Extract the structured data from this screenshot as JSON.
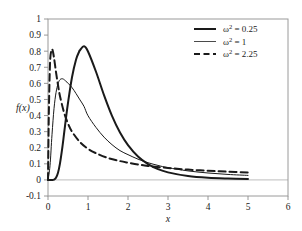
{
  "chart_data": {
    "type": "line",
    "title": "",
    "subtitle": "",
    "xlabel": "x",
    "ylabel": "f(x)",
    "xlim": [
      0,
      6
    ],
    "ylim": [
      -0.1,
      1
    ],
    "xticks": [
      0,
      1,
      2,
      3,
      4,
      5,
      6
    ],
    "xtick_labels": [
      "0",
      "1",
      "2",
      "3",
      "4",
      "5",
      "6"
    ],
    "yticks": [
      -0.1,
      0,
      0.1,
      0.2,
      0.3,
      0.4,
      0.5,
      0.6,
      0.7,
      0.8,
      0.9,
      1
    ],
    "ytick_labels": [
      "-0.1",
      "0",
      "0.1",
      "0.2",
      "0.3",
      "0.4",
      "0.5",
      "0.6",
      "0.7",
      "0.8",
      "0.9",
      "1"
    ],
    "grid": false,
    "legend_position": "top-right",
    "distribution": "lognormal",
    "mu": 0,
    "x_domain": [
      0.0,
      5.0
    ],
    "series": [
      {
        "name": "omega2-0.25",
        "label_base": "ω",
        "label_sup": "2",
        "label_value": " = 0.25",
        "omega2": 0.25,
        "style": "solid-thick",
        "stroke_width": 2.0,
        "dash": "none",
        "color": "#1a1a1a",
        "peak_x": 0.78,
        "peak_y": 0.9,
        "x": [
          0.0,
          0.05,
          0.1,
          0.15,
          0.2,
          0.25,
          0.3,
          0.35,
          0.4,
          0.45,
          0.5,
          0.6,
          0.7,
          0.78,
          0.8,
          0.9,
          1.0,
          1.2,
          1.4,
          1.6,
          1.8,
          2.0,
          2.25,
          2.5,
          2.75,
          3.0,
          3.5,
          4.0,
          4.5,
          5.0
        ],
        "y": [
          0.0,
          0.0,
          0.0,
          0.002,
          0.013,
          0.044,
          0.103,
          0.186,
          0.284,
          0.385,
          0.479,
          0.638,
          0.747,
          0.798,
          0.806,
          0.83,
          0.798,
          0.672,
          0.527,
          0.398,
          0.294,
          0.216,
          0.145,
          0.098,
          0.067,
          0.047,
          0.024,
          0.013,
          0.008,
          0.005
        ]
      },
      {
        "name": "omega2-1",
        "label_base": "ω",
        "label_sup": "2",
        "label_value": " = 1",
        "omega2": 1,
        "style": "solid-thin",
        "stroke_width": 1.0,
        "dash": "none",
        "color": "#4a4a4a",
        "peak_x": 0.37,
        "peak_y": 0.63,
        "x": [
          0.0,
          0.05,
          0.1,
          0.15,
          0.2,
          0.25,
          0.3,
          0.37,
          0.45,
          0.5,
          0.6,
          0.7,
          0.8,
          0.9,
          1.0,
          1.2,
          1.4,
          1.6,
          1.8,
          2.0,
          2.25,
          2.5,
          2.75,
          3.0,
          3.5,
          4.0,
          4.5,
          5.0
        ],
        "y": [
          0.0,
          0.088,
          0.281,
          0.443,
          0.542,
          0.597,
          0.623,
          0.628,
          0.613,
          0.601,
          0.574,
          0.537,
          0.497,
          0.457,
          0.399,
          0.326,
          0.266,
          0.219,
          0.182,
          0.157,
          0.129,
          0.107,
          0.09,
          0.076,
          0.056,
          0.043,
          0.034,
          0.028
        ]
      },
      {
        "name": "omega2-2.25",
        "label_base": "ω",
        "label_sup": "2",
        "label_value": " = 2.25",
        "omega2": 2.25,
        "style": "dashed",
        "stroke_width": 2.0,
        "dash": "7,4",
        "color": "#1a1a1a",
        "peak_x": 0.11,
        "peak_y": 0.81,
        "x": [
          0.0,
          0.02,
          0.05,
          0.08,
          0.11,
          0.15,
          0.2,
          0.25,
          0.3,
          0.4,
          0.5,
          0.6,
          0.8,
          1.0,
          1.2,
          1.5,
          1.8,
          2.0,
          2.25,
          2.5,
          3.0,
          3.5,
          4.0,
          4.5,
          5.0
        ],
        "y": [
          0.0,
          0.4,
          0.72,
          0.8,
          0.81,
          0.76,
          0.67,
          0.59,
          0.52,
          0.42,
          0.35,
          0.3,
          0.235,
          0.193,
          0.166,
          0.136,
          0.117,
          0.107,
          0.096,
          0.087,
          0.074,
          0.064,
          0.057,
          0.051,
          0.046
        ]
      }
    ]
  },
  "legend": {
    "entries": [
      {
        "label": "ω² = 0.25"
      },
      {
        "label": "ω² = 1"
      },
      {
        "label": "ω² = 2.25"
      }
    ]
  }
}
